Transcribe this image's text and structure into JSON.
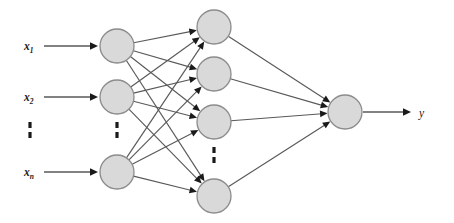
{
  "diagram": {
    "type": "neural-network",
    "title": "",
    "background_color": "#ffffff",
    "node_fill_color": "#d9d9d9",
    "node_stroke_color": "#8c8c8c",
    "edge_color": "#595959",
    "arrow_color": "#1a1a1a",
    "canvas": {
      "width": 454,
      "height": 223
    },
    "layers": [
      {
        "name": "input-layer",
        "node_count_visible": 3,
        "has_ellipsis": true,
        "ellipsis_after_index": 1,
        "nodes": [
          {
            "id": "input-node-1",
            "cx": 117,
            "cy": 46,
            "r": 17
          },
          {
            "id": "input-node-2",
            "cx": 117,
            "cy": 97,
            "r": 17
          },
          {
            "id": "input-node-3",
            "cx": 117,
            "cy": 172,
            "r": 17
          }
        ],
        "ellipsis": {
          "cx": 117,
          "cy": 130,
          "dots": 2
        }
      },
      {
        "name": "hidden-layer",
        "node_count_visible": 4,
        "has_ellipsis": true,
        "ellipsis_after_index": 2,
        "nodes": [
          {
            "id": "hidden-node-1",
            "cx": 214,
            "cy": 27,
            "r": 17
          },
          {
            "id": "hidden-node-2",
            "cx": 214,
            "cy": 74,
            "r": 17
          },
          {
            "id": "hidden-node-3",
            "cx": 214,
            "cy": 122,
            "r": 17
          },
          {
            "id": "hidden-node-4",
            "cx": 214,
            "cy": 196,
            "r": 17
          }
        ],
        "ellipsis": {
          "cx": 214,
          "cy": 155,
          "dots": 2
        }
      },
      {
        "name": "output-layer",
        "node_count_visible": 1,
        "has_ellipsis": false,
        "nodes": [
          {
            "id": "output-node-1",
            "cx": 345,
            "cy": 112,
            "r": 17
          }
        ]
      }
    ],
    "input_labels": [
      {
        "id": "input-label-1",
        "base": "x",
        "sub": "1",
        "x": 24,
        "y": 50
      },
      {
        "id": "input-label-2",
        "base": "x",
        "sub": "2",
        "x": 24,
        "y": 101
      },
      {
        "id": "input-label-3",
        "base": "x",
        "sub": "n",
        "x": 24,
        "y": 176
      }
    ],
    "input_label_ellipsis": {
      "cx": 30,
      "cy": 130,
      "dots": 2
    },
    "output_label": {
      "id": "output-label",
      "text": "y",
      "x": 419,
      "y": 117
    },
    "input_arrows": [
      {
        "id": "input-arrow-1",
        "x1": 44,
        "y1": 46,
        "x2": 98,
        "y2": 46
      },
      {
        "id": "input-arrow-2",
        "x1": 44,
        "y1": 97,
        "x2": 98,
        "y2": 97
      },
      {
        "id": "input-arrow-3",
        "x1": 44,
        "y1": 172,
        "x2": 98,
        "y2": 172
      }
    ],
    "output_arrow": {
      "id": "output-arrow",
      "x1": 363,
      "y1": 112,
      "x2": 411,
      "y2": 112
    },
    "connections_input_to_hidden": [
      {
        "from": "input-node-1",
        "to": "hidden-node-1"
      },
      {
        "from": "input-node-1",
        "to": "hidden-node-2"
      },
      {
        "from": "input-node-1",
        "to": "hidden-node-3"
      },
      {
        "from": "input-node-1",
        "to": "hidden-node-4"
      },
      {
        "from": "input-node-2",
        "to": "hidden-node-1"
      },
      {
        "from": "input-node-2",
        "to": "hidden-node-2"
      },
      {
        "from": "input-node-2",
        "to": "hidden-node-3"
      },
      {
        "from": "input-node-2",
        "to": "hidden-node-4"
      },
      {
        "from": "input-node-3",
        "to": "hidden-node-1"
      },
      {
        "from": "input-node-3",
        "to": "hidden-node-2"
      },
      {
        "from": "input-node-3",
        "to": "hidden-node-3"
      },
      {
        "from": "input-node-3",
        "to": "hidden-node-4"
      }
    ],
    "connections_hidden_to_output": [
      {
        "from": "hidden-node-1",
        "to": "output-node-1"
      },
      {
        "from": "hidden-node-2",
        "to": "output-node-1"
      },
      {
        "from": "hidden-node-3",
        "to": "output-node-1"
      },
      {
        "from": "hidden-node-4",
        "to": "output-node-1"
      }
    ]
  }
}
